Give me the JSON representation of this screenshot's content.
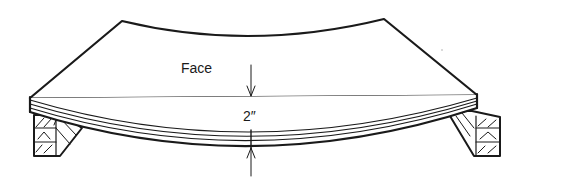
{
  "diagram": {
    "labels": {
      "face": "Face",
      "thickness": "2″"
    },
    "colors": {
      "ink": "#1a1a1a",
      "background": "#ffffff"
    },
    "elements": [
      "curved-panel",
      "left-support-block",
      "right-support-block",
      "deflection-dimension-arrows"
    ]
  }
}
